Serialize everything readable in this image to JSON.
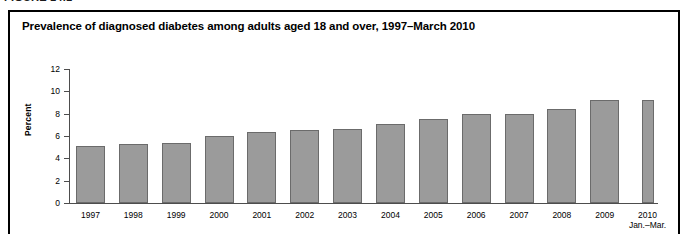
{
  "figure": {
    "label": "FIGURE 14.1",
    "title": "Prevalence of diagnosed diabetes among adults aged 18 and over, 1997–March 2010"
  },
  "chart_data": {
    "type": "bar",
    "title": "Prevalence of diagnosed diabetes among adults aged 18 and over, 1997–March 2010",
    "xlabel": "",
    "ylabel": "Percent",
    "ylim": [
      0,
      12
    ],
    "yticks": [
      0,
      2,
      4,
      6,
      8,
      10,
      12
    ],
    "grid": false,
    "legend": null,
    "categories": [
      "1997",
      "1998",
      "1999",
      "2000",
      "2001",
      "2002",
      "2003",
      "2004",
      "2005",
      "2006",
      "2007",
      "2008",
      "2009",
      "2010"
    ],
    "category_sublabels": [
      "",
      "",
      "",
      "",
      "",
      "",
      "",
      "",
      "",
      "",
      "",
      "",
      "",
      "Jan.–Mar."
    ],
    "values": [
      5.1,
      5.3,
      5.4,
      6.0,
      6.4,
      6.5,
      6.6,
      7.1,
      7.5,
      8.0,
      8.0,
      8.4,
      9.2,
      9.2
    ],
    "bar_color": "#9b9b9b",
    "bar_edge_color": "#6b6b6b"
  }
}
